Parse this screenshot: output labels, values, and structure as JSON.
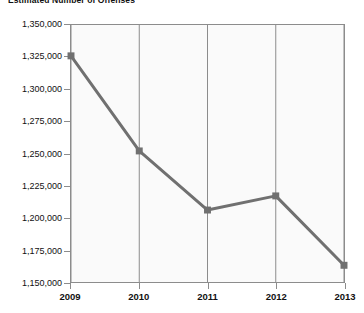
{
  "chart_data": {
    "type": "line",
    "title": "Estimated Number of Offenses",
    "xlabel": "",
    "ylabel": "",
    "categories": [
      "2009",
      "2010",
      "2011",
      "2012",
      "2013"
    ],
    "values": [
      1326000,
      1252000,
      1206000,
      1217000,
      1163000
    ],
    "series": [
      {
        "name": "Estimated Number of Offenses",
        "values": [
          1326000,
          1252000,
          1206000,
          1217000,
          1163000
        ]
      }
    ],
    "ylim": [
      1150000,
      1350000
    ],
    "ytick_step": 25000,
    "ytick_labels": [
      "1,350,000",
      "1,325,000",
      "1,300,000",
      "1,275,000",
      "1,250,000",
      "1,225,000",
      "1,200,000",
      "1,175,000",
      "1,150,000"
    ],
    "ytick_values": [
      1350000,
      1325000,
      1300000,
      1275000,
      1250000,
      1225000,
      1200000,
      1175000,
      1150000
    ],
    "xtick_labels": [
      "2009",
      "2010",
      "2011",
      "2012",
      "2013"
    ],
    "grid": {
      "vertical": true,
      "horizontal": false
    },
    "legend": {
      "visible": false,
      "position": "none"
    },
    "colors": {
      "line": "#707070",
      "marker": "#707070",
      "plot_background": "#fafafa",
      "plot_border": "#8c8c8c",
      "gridline": "#8c8c8c",
      "text": "#111111"
    },
    "marker": {
      "shape": "square",
      "size": 7
    },
    "line_width": 3
  }
}
